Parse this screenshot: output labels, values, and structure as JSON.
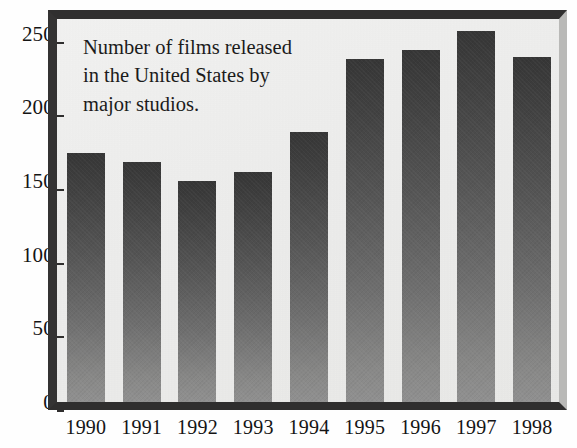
{
  "chart_data": {
    "type": "bar",
    "title": "",
    "annotation": "Number of films released\nin the United States by\nmajor studios.",
    "xlabel": "",
    "ylabel": "",
    "categories": [
      "1990",
      "1991",
      "1992",
      "1993",
      "1994",
      "1995",
      "1996",
      "1997",
      "1998"
    ],
    "values": [
      169,
      163,
      150,
      156,
      183,
      233,
      239,
      252,
      234
    ],
    "ylim": [
      0,
      260
    ],
    "yticks": [
      0,
      50,
      100,
      150,
      200,
      250
    ],
    "ytick_labels": [
      "0",
      "50",
      "100",
      "150",
      "200",
      "250"
    ],
    "grid": false,
    "legend": false,
    "legend_position": "none",
    "series": [
      {
        "name": "Films released by major studios",
        "values": [
          169,
          163,
          150,
          156,
          183,
          233,
          239,
          252,
          234
        ]
      }
    ],
    "colors": {
      "bar_top": "#363636",
      "bar_bottom": "#909090",
      "plot_background": "#efefee",
      "frame_dark": "#2f2e2e",
      "frame_light": "#b9b9b7",
      "text": "#141414",
      "page_background": "#ffffff"
    }
  }
}
